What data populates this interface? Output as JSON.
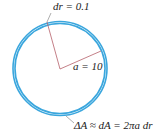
{
  "diagram": {
    "type": "annulus",
    "labels": {
      "dr": "dr = 0.1",
      "radius": "a = 10",
      "area": "ΔA ≈ dA = 2πa dr"
    },
    "colors": {
      "ring": "#3aa6dd",
      "radius_lines": "#b5606a",
      "text": "#222222"
    }
  }
}
